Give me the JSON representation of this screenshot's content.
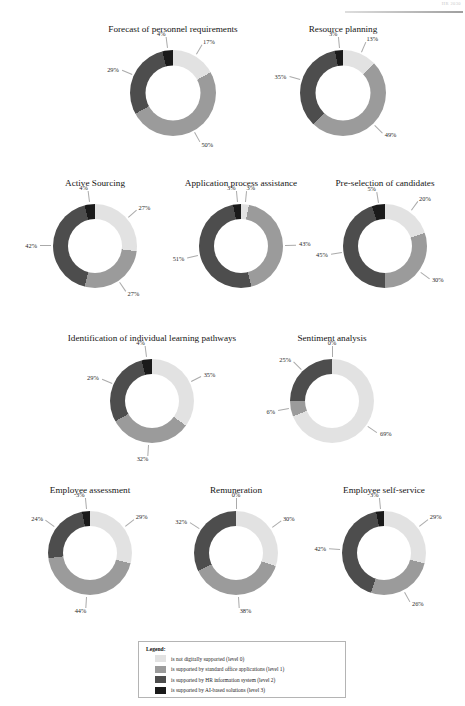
{
  "page": {
    "header_text": "HR 2030"
  },
  "colors": {
    "level0": "#e2e2e2",
    "level1": "#9b9b9b",
    "level2": "#4d4d4d",
    "level3": "#1a1a1a",
    "background": "#ffffff",
    "text": "#1b1b1b",
    "leader_line": "#8d8d8d",
    "legend_border": "#b4b4b4"
  },
  "legend": {
    "title": "Legend:",
    "items": [
      {
        "label": "is not digitally supported (level 0)",
        "color": "#e2e2e2"
      },
      {
        "label": "is supported by standard office applications (level 1)",
        "color": "#9b9b9b"
      },
      {
        "label": "is supported by HR information system (level 2)",
        "color": "#4d4d4d"
      },
      {
        "label": "is supported by AI-based solutions (level 3)",
        "color": "#1a1a1a"
      }
    ]
  },
  "chart_data": [
    {
      "type": "pie",
      "title": "Forecast of personnel requirements",
      "categories": [
        "is not digitally supported (level 0)",
        "is supported by standard office applications (level 1)",
        "is supported by HR information system (level 2)",
        "is supported by AI-based solutions (level 3)"
      ],
      "values": [
        17,
        50,
        29,
        4
      ],
      "labels": [
        "17%",
        "50%",
        "29%",
        "4%"
      ]
    },
    {
      "type": "pie",
      "title": "Resource planning",
      "categories": [
        "is not digitally supported (level 0)",
        "is supported by standard office applications (level 1)",
        "is supported by HR information system (level 2)",
        "is supported by AI-based solutions (level 3)"
      ],
      "values": [
        13,
        49,
        35,
        3
      ],
      "labels": [
        "13%",
        "49%",
        "35%",
        "3%"
      ]
    },
    {
      "type": "pie",
      "title": "Active Sourcing",
      "categories": [
        "is not digitally supported (level 0)",
        "is supported by standard office applications (level 1)",
        "is supported by HR information system (level 2)",
        "is supported by AI-based solutions (level 3)"
      ],
      "values": [
        27,
        27,
        42,
        4
      ],
      "labels": [
        "27%",
        "27%",
        "42%",
        "4%"
      ]
    },
    {
      "type": "pie",
      "title": "Application process assistance",
      "categories": [
        "is not digitally supported (level 0)",
        "is supported by standard office applications (level 1)",
        "is supported by HR information system (level 2)",
        "is supported by AI-based solutions (level 3)"
      ],
      "values": [
        3,
        43,
        51,
        3
      ],
      "labels": [
        "3%",
        "43%",
        "51%",
        "3%"
      ]
    },
    {
      "type": "pie",
      "title": "Pre-selection of candidates",
      "categories": [
        "is not digitally supported (level 0)",
        "is supported by standard office applications (level 1)",
        "is supported by HR information system (level 2)",
        "is supported by AI-based solutions (level 3)"
      ],
      "values": [
        20,
        30,
        45,
        5
      ],
      "labels": [
        "20%",
        "30%",
        "45%",
        "5%"
      ]
    },
    {
      "type": "pie",
      "title": "Identification of individual learning pathways",
      "categories": [
        "is not digitally supported (level 0)",
        "is supported by standard office applications (level 1)",
        "is supported by HR information system (level 2)",
        "is supported by AI-based solutions (level 3)"
      ],
      "values": [
        35,
        32,
        29,
        4
      ],
      "labels": [
        "35%",
        "32%",
        "29%",
        "4%"
      ]
    },
    {
      "type": "pie",
      "title": "Sentiment analysis",
      "categories": [
        "is not digitally supported (level 0)",
        "is supported by standard office applications (level 1)",
        "is supported by HR information system (level 2)",
        "is supported by AI-based solutions (level 3)"
      ],
      "values": [
        69,
        6,
        25,
        0
      ],
      "labels": [
        "69%",
        "6%",
        "25%",
        "0%"
      ]
    },
    {
      "type": "pie",
      "title": "Employee assessment",
      "categories": [
        "is not digitally supported (level 0)",
        "is supported by standard office applications (level 1)",
        "is supported by HR information system (level 2)",
        "is supported by AI-based solutions (level 3)"
      ],
      "values": [
        29,
        44,
        24,
        3
      ],
      "labels": [
        "29%",
        "44%",
        "24%",
        "3%"
      ]
    },
    {
      "type": "pie",
      "title": "Remuneration",
      "categories": [
        "is not digitally supported (level 0)",
        "is supported by standard office applications (level 1)",
        "is supported by HR information system (level 2)",
        "is supported by AI-based solutions (level 3)"
      ],
      "values": [
        30,
        38,
        32,
        0
      ],
      "labels": [
        "30%",
        "38%",
        "32%",
        "0%"
      ]
    },
    {
      "type": "pie",
      "title": "Employee self-service",
      "categories": [
        "is not digitally supported (level 0)",
        "is supported by standard office applications (level 1)",
        "is supported by HR information system (level 2)",
        "is supported by AI-based solutions (level 3)"
      ],
      "values": [
        29,
        26,
        42,
        3
      ],
      "labels": [
        "29%",
        "26%",
        "42%",
        "3%"
      ]
    }
  ],
  "layout": {
    "charts": [
      {
        "left": 78,
        "top": 24,
        "width": 190,
        "donut": 86,
        "hole": 0.645
      },
      {
        "left": 258,
        "top": 24,
        "width": 170,
        "donut": 86,
        "hole": 0.645
      },
      {
        "left": 20,
        "top": 178,
        "width": 150,
        "donut": 84,
        "hole": 0.645
      },
      {
        "left": 162,
        "top": 178,
        "width": 158,
        "donut": 84,
        "hole": 0.645
      },
      {
        "left": 310,
        "top": 178,
        "width": 150,
        "donut": 84,
        "hole": 0.645
      },
      {
        "left": 52,
        "top": 333,
        "width": 200,
        "donut": 84,
        "hole": 0.645
      },
      {
        "left": 252,
        "top": 333,
        "width": 160,
        "donut": 84,
        "hole": 0.645
      },
      {
        "left": 14,
        "top": 485,
        "width": 152,
        "donut": 84,
        "hole": 0.645
      },
      {
        "left": 160,
        "top": 485,
        "width": 152,
        "donut": 84,
        "hole": 0.645
      },
      {
        "left": 308,
        "top": 485,
        "width": 152,
        "donut": 84,
        "hole": 0.645
      }
    ]
  }
}
